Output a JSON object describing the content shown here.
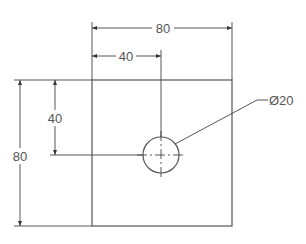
{
  "drawing": {
    "type": "technical-drawing",
    "part": "square plate with centered hole",
    "colors": {
      "line": "#555555",
      "text": "#555555",
      "background": "#ffffff"
    },
    "dimensions": {
      "overall_width": {
        "label": "80",
        "value": 80
      },
      "hole_x_offset": {
        "label": "40",
        "value": 40
      },
      "overall_height": {
        "label": "80",
        "value": 80
      },
      "hole_y_offset": {
        "label": "40",
        "value": 40
      },
      "hole_diameter": {
        "label": "Ø20",
        "value": 20
      }
    }
  }
}
